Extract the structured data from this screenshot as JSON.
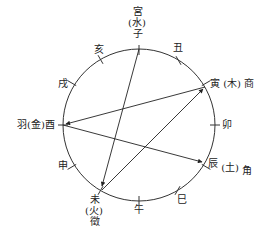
{
  "diagram": {
    "type": "circle-of-fifths-twelve-branches",
    "center": [
      139,
      125
    ],
    "radius": 76,
    "line_color": "#333333",
    "branches": [
      "子",
      "丑",
      "寅",
      "卯",
      "辰",
      "巳",
      "午",
      "未",
      "申",
      "酉",
      "戌",
      "亥"
    ],
    "labels": {
      "zi": {
        "note": "宮",
        "element": "(水)",
        "branch": "子"
      },
      "chou": {
        "branch": "丑"
      },
      "yin": {
        "branch": "寅",
        "element": "(木)",
        "note": "商"
      },
      "mao": {
        "branch": "卯"
      },
      "chen": {
        "branch": "辰",
        "element": "(土)",
        "note": "角"
      },
      "si": {
        "branch": "巳"
      },
      "wu": {
        "branch": "午"
      },
      "wei": {
        "branch": "未",
        "element": "(火)",
        "note": "徵"
      },
      "shen": {
        "branch": "申"
      },
      "you": {
        "note": "羽",
        "element": "(金)",
        "branch": "酉"
      },
      "xu": {
        "branch": "戌"
      },
      "hai": {
        "branch": "亥"
      }
    },
    "arrows": [
      {
        "from": "子",
        "to": "未"
      },
      {
        "from": "未",
        "to": "寅"
      },
      {
        "from": "寅",
        "to": "酉"
      },
      {
        "from": "酉",
        "to": "辰"
      }
    ]
  }
}
